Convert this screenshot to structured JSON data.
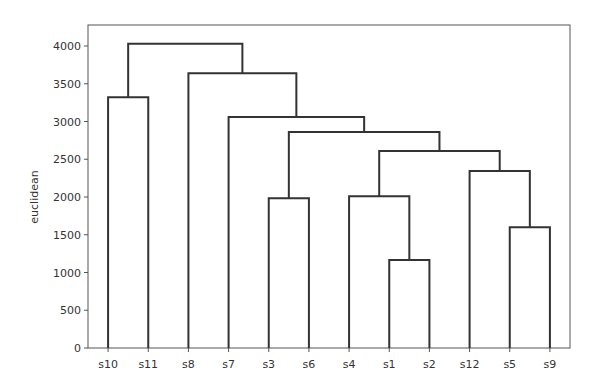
{
  "chart_data": {
    "type": "dendrogram",
    "title": "",
    "xlabel": "",
    "ylabel": "euclidean",
    "ylim": [
      0,
      4200
    ],
    "yticks": [
      0,
      500,
      1000,
      1500,
      2000,
      2500,
      3000,
      3500,
      4000
    ],
    "grid": false,
    "leaves": [
      "s10",
      "s11",
      "s8",
      "s7",
      "s3",
      "s6",
      "s4",
      "s1",
      "s2",
      "s12",
      "s5",
      "s9"
    ],
    "links": [
      {
        "left": "s1",
        "right": "s2",
        "height": 1165
      },
      {
        "left": "s5",
        "right": "s9",
        "height": 1600
      },
      {
        "left": "s3",
        "right": "s6",
        "height": 1985
      },
      {
        "left": "s4",
        "right": "(s1,s2)",
        "height": 2010
      },
      {
        "left": "s12",
        "right": "(s5,s9)",
        "height": 2345
      },
      {
        "left": "(s4,s1,s2)",
        "right": "(s12,s5,s9)",
        "height": 2610
      },
      {
        "left": "(s3,s6)",
        "right": "(s4,s1,s2,s12,s5,s9)",
        "height": 2860
      },
      {
        "left": "s7",
        "right": "(s3..s9)",
        "height": 3060
      },
      {
        "left": "s8",
        "right": "(s7..s9)",
        "height": 3640
      },
      {
        "left": "s10",
        "right": "s11",
        "height": 3320
      },
      {
        "left": "(s10,s11)",
        "right": "(s8..s9)",
        "height": 4030
      }
    ],
    "colors": {
      "line": "#333333",
      "axis": "#555555"
    }
  }
}
